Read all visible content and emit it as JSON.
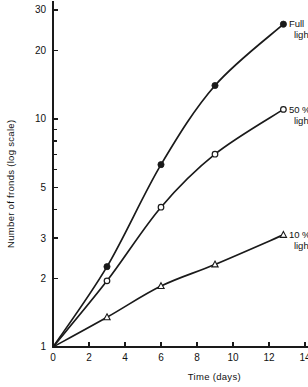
{
  "chart_data": {
    "type": "line",
    "title": "",
    "xlabel": "Time (days)",
    "ylabel": "Number of fronds (log scale)",
    "yscale": "log",
    "xlim": [
      0,
      14.6
    ],
    "ylim": [
      1,
      33
    ],
    "grid": false,
    "legend_position": "inline-right-end-of-curve",
    "xticks": [
      0,
      2,
      4,
      6,
      8,
      10,
      12,
      14
    ],
    "xticklabels": [
      "0",
      "2",
      "4",
      "6",
      "8",
      "10",
      "12",
      "14"
    ],
    "yticks": [
      1,
      2,
      3,
      5,
      10,
      20,
      30
    ],
    "yticklabels": [
      "1",
      "2",
      "3",
      "5",
      "10",
      "20",
      "30"
    ],
    "yminorticks": [
      4,
      6,
      7,
      8,
      9
    ],
    "series": [
      {
        "name": "Full light",
        "label": "Full",
        "label2": "light",
        "marker": "filled-circle",
        "x": [
          0,
          3,
          6,
          9,
          12.8
        ],
        "y": [
          1,
          2.25,
          6.3,
          14.0,
          26.0
        ]
      },
      {
        "name": "50 % light",
        "label": "50 %",
        "label2": "light",
        "marker": "open-circle",
        "x": [
          0,
          3,
          6,
          9,
          12.8
        ],
        "y": [
          1,
          1.95,
          4.1,
          7.0,
          11.0
        ]
      },
      {
        "name": "10 % light",
        "label": "10 %",
        "label2": "light",
        "marker": "open-triangle",
        "x": [
          0,
          3,
          6,
          9,
          12.8
        ],
        "y": [
          1,
          1.35,
          1.85,
          2.3,
          3.1
        ]
      }
    ]
  },
  "axes": {
    "x_title": "Time (days)",
    "y_title": "Number of fronds (log scale)"
  },
  "colors": {
    "ink": "#1a1a1a",
    "background": "#ffffff"
  }
}
